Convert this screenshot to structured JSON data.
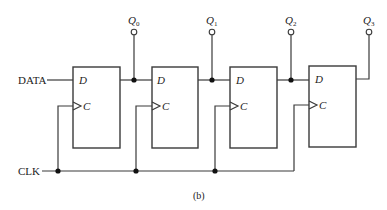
{
  "diagram": {
    "type": "4-bit serial-in parallel-out shift register (D flip-flops)",
    "caption": "(b)",
    "inputs": {
      "data_label": "DATA",
      "clock_label": "CLK"
    },
    "flip_flops": [
      {
        "d_label": "D",
        "c_label": "C",
        "output_name": "Q",
        "output_sub": "0"
      },
      {
        "d_label": "D",
        "c_label": "C",
        "output_name": "Q",
        "output_sub": "1"
      },
      {
        "d_label": "D",
        "c_label": "C",
        "output_name": "Q",
        "output_sub": "2"
      },
      {
        "d_label": "D",
        "c_label": "C",
        "output_name": "Q",
        "output_sub": "3"
      }
    ],
    "colors": {
      "wire": "#3a3a3a",
      "junction": "#111111",
      "background": "#ffffff"
    }
  }
}
